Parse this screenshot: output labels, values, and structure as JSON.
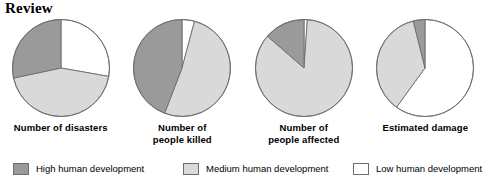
{
  "page_title": "Review",
  "colors": {
    "high": "#9a9a9a",
    "medium": "#d9d9d9",
    "low": "#ffffff",
    "outline": "#6e6e6e",
    "text": "#000000"
  },
  "legend": {
    "items": [
      {
        "label": "High human development",
        "color_key": "high",
        "swatch": "#9a9a9a"
      },
      {
        "label": "Medium human development",
        "color_key": "medium",
        "swatch": "#d9d9d9"
      },
      {
        "label": "Low human development",
        "color_key": "low",
        "swatch": "#ffffff"
      }
    ]
  },
  "chart_data": [
    {
      "type": "pie",
      "title": "Number of disasters",
      "title_lines": [
        "Number of disasters",
        ""
      ],
      "categories": [
        "Low human development",
        "Medium human development",
        "High human development"
      ],
      "values": [
        28,
        44,
        28
      ],
      "slice_colors": [
        "#ffffff",
        "#d9d9d9",
        "#9a9a9a"
      ],
      "start_angle_deg": 0,
      "direction": "clockwise",
      "boundaries_deg": [
        0,
        100,
        258,
        360
      ]
    },
    {
      "type": "pie",
      "title": "Number of people killed",
      "title_lines": [
        "Number of",
        "people killed"
      ],
      "categories": [
        "Low human development",
        "Medium human development",
        "High human development"
      ],
      "values": [
        4,
        51,
        45
      ],
      "slice_colors": [
        "#ffffff",
        "#d9d9d9",
        "#9a9a9a"
      ],
      "start_angle_deg": 0,
      "direction": "clockwise",
      "boundaries_deg": [
        0,
        15,
        201,
        360
      ]
    },
    {
      "type": "pie",
      "title": "Number of people affected",
      "title_lines": [
        "Number of",
        "people affected"
      ],
      "categories": [
        "Low human development",
        "Medium human development",
        "High human development"
      ],
      "values": [
        1,
        86,
        13
      ],
      "slice_colors": [
        "#ffffff",
        "#d9d9d9",
        "#9a9a9a"
      ],
      "start_angle_deg": 0,
      "direction": "clockwise",
      "boundaries_deg": [
        0,
        4,
        311,
        360
      ]
    },
    {
      "type": "pie",
      "title": "Estimated damage",
      "title_lines": [
        "Estimated damage",
        ""
      ],
      "categories": [
        "Low human development",
        "Medium human development",
        "High human development"
      ],
      "values": [
        60,
        36,
        4
      ],
      "slice_colors": [
        "#ffffff",
        "#d9d9d9",
        "#9a9a9a"
      ],
      "start_angle_deg": 0,
      "direction": "clockwise",
      "boundaries_deg": [
        0,
        216,
        346,
        360
      ]
    }
  ]
}
